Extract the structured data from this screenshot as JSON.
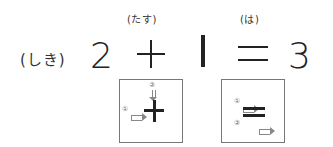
{
  "equation": {
    "label": "(しき)",
    "operand1": "2",
    "plus_sign": "+",
    "operand2": "|",
    "equals_sign": "=",
    "result": "3",
    "plus_reading": "(たす)",
    "equals_reading": "(は)"
  },
  "stroke_guides": {
    "plus": {
      "step1": "①",
      "step2": "②"
    },
    "equals": {
      "step1": "①",
      "step2": "②"
    }
  }
}
